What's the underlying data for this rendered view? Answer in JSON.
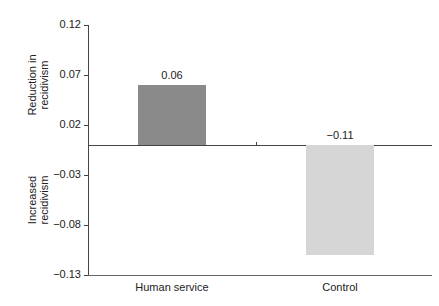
{
  "chart_data": {
    "type": "bar",
    "title": "",
    "xlabel": "",
    "ylabel_top": "Reduction in recidivism",
    "ylabel_bottom": "Increased recidivism",
    "categories": [
      "Human service",
      "Control"
    ],
    "values": [
      0.06,
      -0.11
    ],
    "value_labels": [
      "0.06",
      "−0.11"
    ],
    "colors": [
      "#8a8a8a",
      "#d6d6d6"
    ],
    "ylim": [
      -0.13,
      0.12
    ],
    "yticks": [
      0.12,
      0.07,
      0.02,
      -0.03,
      -0.08,
      -0.13
    ],
    "ytick_labels": [
      "0.12",
      "0.07",
      "0.02",
      "−0.03",
      "−0.08",
      "−0.13"
    ],
    "grid": false,
    "legend": null
  },
  "labels": {
    "y_top_line1": "Reduction in",
    "y_top_line2": "recidivism",
    "y_bottom_line1": "Increased",
    "y_bottom_line2": "recidivism"
  }
}
